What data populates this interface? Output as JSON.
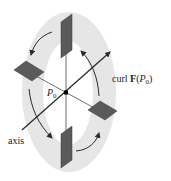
{
  "figure": {
    "labels": {
      "curl_prefix": "curl ",
      "curl_F": "F",
      "curl_open": "(",
      "curl_P": "P",
      "curl_sub": "0",
      "curl_close": ")",
      "point_P": "P",
      "point_sub": "0",
      "axis": "axis"
    },
    "colors": {
      "ring": "#e6e6e6",
      "paddle": "#5a5a5a",
      "paddle_edge": "#3a3a3a",
      "line": "#3a3a3a",
      "axis_line": "#2a2a2a",
      "arrow": "#2a2a2a",
      "center_point": "#000000"
    }
  }
}
